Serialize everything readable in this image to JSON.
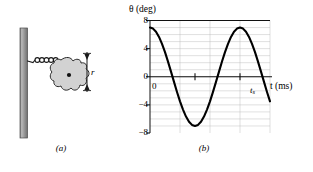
{
  "figure": {
    "panel_a": {
      "caption": "(a)",
      "name": "spring-block-on-wall-diagram",
      "wall_icon": "hatched-wall",
      "spring_icon": "coil-spring",
      "body_icon": "irregular-blob",
      "pivot_icon": "center-dot",
      "radius_label": "r",
      "radius_arrow_icon": "double-headed-vertical-arrow",
      "spring_coils": 5,
      "wall": {
        "x": 20,
        "y": 28,
        "width": 7,
        "height": 110
      },
      "spring": {
        "x1": 27,
        "y1": 62,
        "x2": 63,
        "y2": 62
      },
      "blob_center": {
        "x": 62,
        "y": 74
      },
      "radius_arrow": {
        "x": 87,
        "y_top": 52,
        "y_bottom": 92
      }
    },
    "panel_b": {
      "caption": "(b)"
    }
  },
  "chart_data": {
    "type": "line",
    "title": "",
    "ylabel": "θ (deg)",
    "xlabel": "t (ms)",
    "ytick_labels": [
      "8",
      "4",
      "0",
      "−4",
      "−8"
    ],
    "ytick_values": [
      8,
      4,
      0,
      -4,
      -8
    ],
    "ylim": [
      -8,
      8
    ],
    "xlim": [
      0,
      4
    ],
    "origin_label": "0",
    "annotations": [
      {
        "text": "t",
        "sub": "s",
        "x_value": 3.0,
        "name": "ts-annotation"
      }
    ],
    "grid": true,
    "grid_minor_rows": 16,
    "grid_major_cols": 4,
    "legend": null,
    "series": [
      {
        "name": "theta-vs-time",
        "description": "cosine-like oscillation, amplitude 7 deg, period 3 ms",
        "amplitude": 7,
        "period": 3.0,
        "phase": 0,
        "x": [
          0.0,
          0.1,
          0.2,
          0.3,
          0.4,
          0.5,
          0.6,
          0.7,
          0.8,
          0.9,
          1.0,
          1.1,
          1.2,
          1.3,
          1.4,
          1.5,
          1.6,
          1.7,
          1.8,
          1.9,
          2.0,
          2.1,
          2.2,
          2.3,
          2.4,
          2.5,
          2.6,
          2.7,
          2.8,
          2.9,
          3.0,
          3.1,
          3.2,
          3.3,
          3.4,
          3.5,
          3.6,
          3.7,
          3.8,
          3.9,
          4.0
        ],
        "y": [
          7.0,
          6.85,
          6.39,
          5.66,
          4.67,
          3.5,
          2.16,
          0.73,
          -0.73,
          -2.16,
          -3.5,
          -4.67,
          -5.66,
          -6.39,
          -6.85,
          -7.0,
          -6.85,
          -6.39,
          -5.66,
          -4.67,
          -3.5,
          -2.16,
          -0.73,
          0.73,
          2.16,
          3.5,
          4.67,
          5.66,
          6.39,
          6.85,
          7.0,
          6.85,
          6.39,
          5.66,
          4.67,
          3.5,
          2.16,
          0.73,
          -0.73,
          -2.16,
          -3.5
        ]
      }
    ]
  }
}
